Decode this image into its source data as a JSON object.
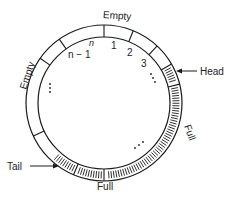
{
  "diagram": {
    "type": "circular-buffer",
    "center": [
      104,
      103
    ],
    "outer_radius": 78,
    "inner_radius": 66,
    "stroke_color": "#1a1a1a",
    "background": "#ffffff",
    "region_labels": {
      "empty_top": "Empty",
      "empty_left": "Empty",
      "full_right": "Full",
      "full_bottom": "Full"
    },
    "slot_labels": {
      "n": "n",
      "n_minus_1": "n − 1",
      "one": "1",
      "two": "2",
      "three": "3"
    },
    "ellipsis": {
      "top_right": "⋮",
      "left": "⋮",
      "bottom_right": "⋰"
    },
    "pointers": {
      "head": "Head",
      "tail": "Tail"
    },
    "dividers_deg": [
      0,
      22,
      43,
      60,
      76,
      180,
      203,
      245,
      305,
      325
    ],
    "full_arcs_deg": [
      [
        60,
        76
      ],
      [
        76,
        180
      ],
      [
        180,
        203
      ],
      [
        203,
        225
      ]
    ],
    "empty_regions": [
      [
        225,
        360
      ],
      [
        0,
        60
      ]
    ]
  }
}
